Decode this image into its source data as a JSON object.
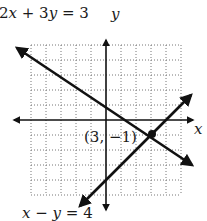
{
  "graph": {
    "title": "System of linear equations",
    "x_axis_label": "x",
    "y_axis_label": "y",
    "grid": {
      "x_min": -5,
      "x_max": 5,
      "y_min": -5,
      "y_max": 5,
      "step": 1,
      "style": "dotted"
    },
    "lines": [
      {
        "equation": "2x + 3y = 3",
        "label_parts": [
          "2",
          "x",
          " + 3",
          "y",
          " = 3"
        ]
      },
      {
        "equation": "x − y = 4",
        "label_parts": [
          "x",
          " − ",
          "y",
          " = 4"
        ]
      }
    ],
    "intersection": {
      "label": "(3, −1)",
      "x": 3,
      "y": -1
    }
  }
}
